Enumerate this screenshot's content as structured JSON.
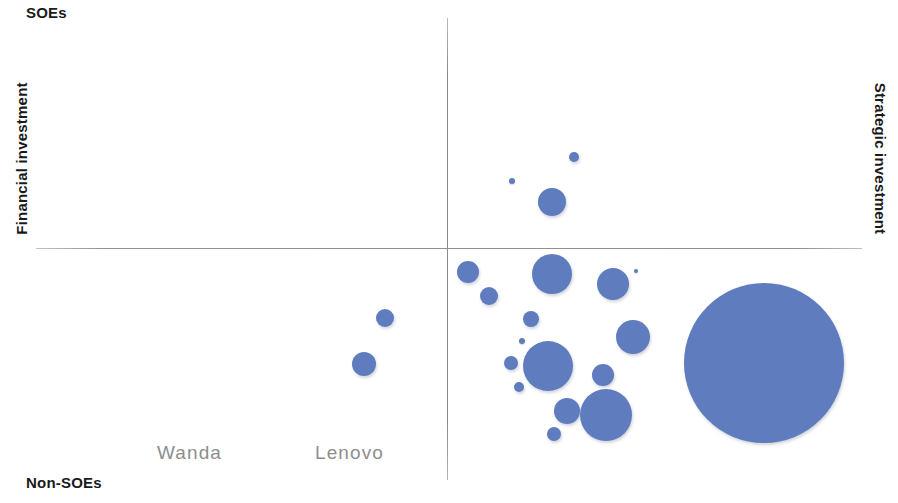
{
  "chart_data": {
    "type": "scatter",
    "title": "",
    "subtitle": "",
    "xlabel": "",
    "ylabel": "",
    "axes": {
      "horizontal_axis_label_left": "Financial investment",
      "horizontal_axis_label_right": "Strategic investment",
      "vertical_axis_label_top": "SOEs",
      "vertical_axis_label_bottom": "Non-SOEs",
      "origin_x_px": 447,
      "origin_y_px": 248,
      "x_range_px": [
        36,
        862
      ],
      "y_range_px": [
        18,
        480
      ]
    },
    "grid": false,
    "legend": null,
    "bubble_color": "#5e7cbe",
    "label_color": "#8d8d8d",
    "quadrant_note": "Four-quadrant bubble map: vertical axis SOEs (top) to Non-SOEs (bottom); horizontal axis Financial investment (left) to Strategic investment (right).",
    "points": [
      {
        "id": "p01",
        "label": "",
        "cx": 512,
        "cy": 181,
        "r": 3
      },
      {
        "id": "p02",
        "label": "",
        "cx": 574,
        "cy": 157,
        "r": 5
      },
      {
        "id": "p03",
        "label": "",
        "cx": 552,
        "cy": 202,
        "r": 14
      },
      {
        "id": "p04",
        "label": "",
        "cx": 468,
        "cy": 272,
        "r": 11
      },
      {
        "id": "p05",
        "label": "",
        "cx": 489,
        "cy": 296,
        "r": 9
      },
      {
        "id": "p06",
        "label": "",
        "cx": 552,
        "cy": 274,
        "r": 20
      },
      {
        "id": "p07",
        "label": "",
        "cx": 613,
        "cy": 284,
        "r": 16
      },
      {
        "id": "p08",
        "label": "",
        "cx": 636,
        "cy": 271,
        "r": 2
      },
      {
        "id": "p09",
        "label": "",
        "cx": 385,
        "cy": 318,
        "r": 9
      },
      {
        "id": "p10",
        "label": "",
        "cx": 364,
        "cy": 364,
        "r": 12
      },
      {
        "id": "p11",
        "label": "",
        "cx": 531,
        "cy": 319,
        "r": 8
      },
      {
        "id": "p12",
        "label": "",
        "cx": 522,
        "cy": 341,
        "r": 3
      },
      {
        "id": "p13",
        "label": "",
        "cx": 548,
        "cy": 366,
        "r": 25
      },
      {
        "id": "p14",
        "label": "",
        "cx": 633,
        "cy": 337,
        "r": 17
      },
      {
        "id": "p15",
        "label": "",
        "cx": 511,
        "cy": 363,
        "r": 7
      },
      {
        "id": "p16",
        "label": "",
        "cx": 519,
        "cy": 387,
        "r": 5
      },
      {
        "id": "p17",
        "label": "",
        "cx": 603,
        "cy": 375,
        "r": 11
      },
      {
        "id": "p18",
        "label": "",
        "cx": 567,
        "cy": 411,
        "r": 13
      },
      {
        "id": "p19",
        "label": "",
        "cx": 554,
        "cy": 434,
        "r": 7
      },
      {
        "id": "p20",
        "label": "Wanda",
        "cx": 606,
        "cy": 415,
        "r": 26
      },
      {
        "id": "p21",
        "label": "Lenovo",
        "cx": 764,
        "cy": 363,
        "r": 80
      }
    ],
    "annotations": [
      {
        "text": "Wanda",
        "x": 606,
        "y": 455,
        "color": "#8d8d8d"
      },
      {
        "text": "Lenovo",
        "x": 764,
        "y": 455,
        "color": "#8d8d8d"
      }
    ]
  },
  "labels": {
    "soes": "SOEs",
    "non_soes": "Non-SOEs",
    "financial_investment": "Financial investment",
    "strategic_investment": "Strategic investment"
  }
}
